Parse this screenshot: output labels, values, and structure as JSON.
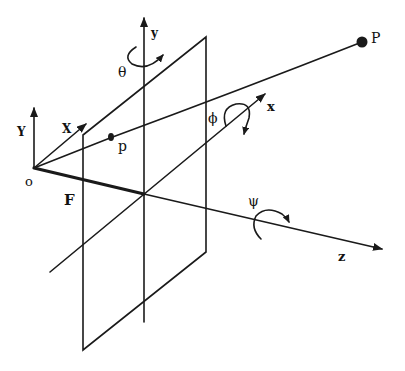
{
  "diagram": {
    "type": "camera-projection-geometry",
    "colors": {
      "line": "#1a1a1a",
      "background": "#ffffff"
    },
    "labels": {
      "origin": "o",
      "focal_length": "F",
      "camera_y": "Y",
      "camera_x": "X",
      "image_point": "p",
      "world_point": "P",
      "plane_y": "y",
      "plane_x": "x",
      "plane_z": "z",
      "theta": "θ",
      "phi": "ϕ",
      "psi": "ψ"
    }
  }
}
